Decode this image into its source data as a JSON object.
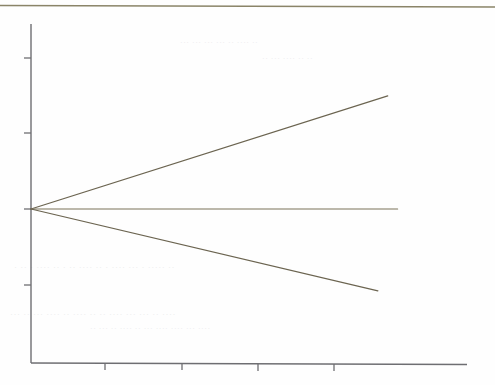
{
  "figure": {
    "background_color": "#fefefe",
    "page_rule_color": "#8a8468",
    "axis_color": "#6e6e72",
    "line_color": "#6b6450",
    "ghost_color": "#e9e9ea"
  },
  "chart_data": {
    "type": "line",
    "title": "",
    "subtitle": "",
    "xlabel": "",
    "ylabel": "",
    "grid": false,
    "legend": null,
    "xlim": [
      0,
      5.75
    ],
    "ylim": [
      -2.05,
      2.45
    ],
    "xticks": [
      0,
      1,
      2,
      3,
      4
    ],
    "yticks": [
      -1,
      0,
      1,
      2
    ],
    "xticklabels": [
      "",
      "",
      "",
      "",
      ""
    ],
    "yticklabels": [
      "",
      "",
      "",
      ""
    ],
    "annotations": [],
    "series": [
      {
        "name": "upper-branch",
        "x": [
          0,
          4.7
        ],
        "y": [
          0,
          1.49
        ],
        "slope": 0.317,
        "color": "#6b6450"
      },
      {
        "name": "middle-branch",
        "x": [
          0,
          4.83
        ],
        "y": [
          0,
          0
        ],
        "slope": 0,
        "color": "#6b6450"
      },
      {
        "name": "lower-branch",
        "x": [
          0,
          4.57
        ],
        "y": [
          0,
          -1.08
        ],
        "slope": -0.236,
        "color": "#6b6450"
      }
    ]
  },
  "page_artifacts": {
    "top_rule_label": "page-edge-rule",
    "ghost_marks": [
      {
        "text": "· ·· ·   ···· ··  · ·· ···· ·· · ···· ··· · ····· ··",
        "x": 14,
        "y": 268,
        "size": 9,
        "opacity": 0.8
      },
      {
        "text": "··· ·· ··· ···· ·· ···· ·· ·· ···· ··· ··· ·· ····",
        "x": 10,
        "y": 315,
        "size": 9,
        "opacity": 0.7
      },
      {
        "text": "·· ··· ··  ···· ·· ··· ···· ···· ··· ····",
        "x": 90,
        "y": 330,
        "size": 8,
        "opacity": 0.6
      },
      {
        "text": "··· ··· ··· ··· ·· ···· ··",
        "x": 180,
        "y": 44,
        "size": 8,
        "opacity": 0.5
      },
      {
        "text": "·· ··· ···· ·· ··",
        "x": 262,
        "y": 60,
        "size": 8,
        "opacity": 0.45
      }
    ]
  }
}
